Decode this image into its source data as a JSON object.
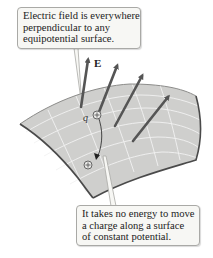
{
  "callouts": {
    "top": {
      "lines": [
        "Electric field is everywhere",
        "perpendicular to any",
        "equipotential surface."
      ]
    },
    "bottom": {
      "lines": [
        "It takes no energy to move",
        "a charge along a surface",
        "of constant potential."
      ]
    }
  },
  "labels": {
    "field": "E",
    "charge": "q"
  },
  "colors": {
    "surface_fill": "#cfcfcd",
    "surface_edge": "#4a4a4a",
    "grid": "#f2f2f2",
    "arrow": "#555555",
    "callout_bg": "#f7f7f4",
    "callout_border": "#a9a9a6"
  }
}
